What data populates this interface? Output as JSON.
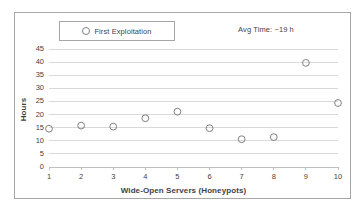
{
  "chart_data": {
    "type": "scatter",
    "title": "",
    "xlabel": "Wide-Open Servers (Honeypots)",
    "ylabel": "Hours",
    "xlim": [
      1,
      10
    ],
    "ylim": [
      0,
      45
    ],
    "grid": true,
    "legend_position": "top-left",
    "x": [
      1,
      2,
      3,
      4,
      5,
      6,
      7,
      8,
      9,
      10
    ],
    "xticklabels": [
      "1",
      "2",
      "3",
      "4",
      "5",
      "6",
      "7",
      "8",
      "9",
      "10"
    ],
    "yticklabels": [
      "0",
      "5",
      "10",
      "15",
      "20",
      "25",
      "30",
      "35",
      "40",
      "45"
    ],
    "yticks": [
      0,
      5,
      10,
      15,
      20,
      25,
      30,
      35,
      40,
      45
    ],
    "series": [
      {
        "name": "First Exploitation",
        "marker": "open-circle",
        "color": "#808080",
        "values": [
          14.6,
          15.8,
          15.4,
          18.6,
          21.1,
          14.8,
          10.6,
          11.4,
          39.7,
          24.4
        ]
      }
    ],
    "annotations": [
      {
        "text": "Avg Time: ~19 h"
      }
    ]
  },
  "legend": {
    "label": "First Exploitation",
    "marker_name": "open-circle-marker"
  },
  "annotation": {
    "text": "Avg Time: ~19 h"
  },
  "axes": {
    "x_title": "Wide-Open Servers (Honeypots)",
    "y_title": "Hours"
  },
  "colors": {
    "marker": "#808080",
    "gridline": "#d9d9d9",
    "axis": "#bfbfbf",
    "border": "#a6a6a6",
    "text": "#3f3f3f"
  }
}
